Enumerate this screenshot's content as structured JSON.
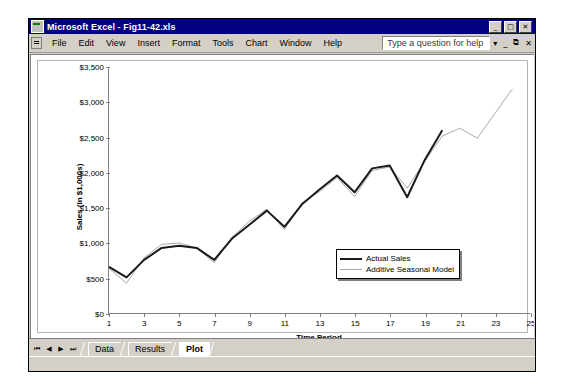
{
  "window": {
    "title": "Microsoft Excel - Fig11-42.xls",
    "icon": "excel-icon",
    "minimize_label": "_",
    "restore_label": "□",
    "close_label": "✕"
  },
  "menubar": {
    "items": [
      {
        "label": "File"
      },
      {
        "label": "Edit"
      },
      {
        "label": "View"
      },
      {
        "label": "Insert"
      },
      {
        "label": "Format"
      },
      {
        "label": "Tools"
      },
      {
        "label": "Chart"
      },
      {
        "label": "Window"
      },
      {
        "label": "Help"
      }
    ],
    "help_box_placeholder": "Type a question for help",
    "dropdown_label": "▾",
    "doc_minimize_label": "_",
    "doc_restore_label": "⧉",
    "doc_close_label": "✕"
  },
  "sheet_tabs": {
    "nav_first": "⏮",
    "nav_prev": "◀",
    "nav_next": "▶",
    "nav_last": "⏭",
    "tabs": [
      {
        "label": "Data",
        "active": false
      },
      {
        "label": "Results",
        "active": false
      },
      {
        "label": "Plot",
        "active": true
      }
    ]
  },
  "chart_data": {
    "type": "line",
    "title": "",
    "xlabel": "Time Period",
    "ylabel": "Sales (in $1,000s)",
    "xlim": [
      1,
      25
    ],
    "ylim": [
      0,
      3500
    ],
    "yticks": [
      0,
      500,
      1000,
      1500,
      2000,
      2500,
      3000,
      3500
    ],
    "ytick_labels": [
      "$0",
      "$500",
      "$1,000",
      "$1,500",
      "$2,000",
      "$2,500",
      "$3,000",
      "$3,500"
    ],
    "xticks": [
      1,
      3,
      5,
      7,
      9,
      11,
      13,
      15,
      17,
      19,
      21,
      23,
      25
    ],
    "xtick_labels": [
      "1",
      "3",
      "5",
      "7",
      "9",
      "11",
      "13",
      "15",
      "17",
      "19",
      "21",
      "23",
      "25"
    ],
    "grid": false,
    "legend_position": "inside-lower-right",
    "series": [
      {
        "name": "Actual Sales",
        "color": "#1a1a1a",
        "width": 2,
        "x": [
          1,
          2,
          3,
          4,
          5,
          6,
          7,
          8,
          9,
          10,
          11,
          12,
          13,
          14,
          15,
          16,
          17,
          18,
          19,
          20
        ],
        "values": [
          660,
          512,
          760,
          930,
          960,
          930,
          760,
          1060,
          1260,
          1460,
          1230,
          1550,
          1760,
          1960,
          1720,
          2060,
          2100,
          1650,
          2180,
          2600
        ]
      },
      {
        "name": "Additive Seasonal Model",
        "color": "#a8a8a8",
        "width": 1,
        "x": [
          1,
          2,
          3,
          4,
          5,
          6,
          7,
          8,
          9,
          10,
          11,
          12,
          13,
          14,
          15,
          16,
          17,
          18,
          19,
          20,
          21,
          22,
          23,
          24
        ],
        "values": [
          640,
          430,
          790,
          980,
          1000,
          930,
          720,
          1080,
          1310,
          1480,
          1190,
          1570,
          1730,
          1930,
          1660,
          2030,
          2080,
          1780,
          2160,
          2520,
          2630,
          2490,
          2840,
          3190
        ]
      }
    ],
    "legend": [
      {
        "label": "Actual Sales",
        "color": "#1a1a1a"
      },
      {
        "label": "Additive Seasonal Model",
        "color": "#a8a8a8"
      }
    ]
  }
}
